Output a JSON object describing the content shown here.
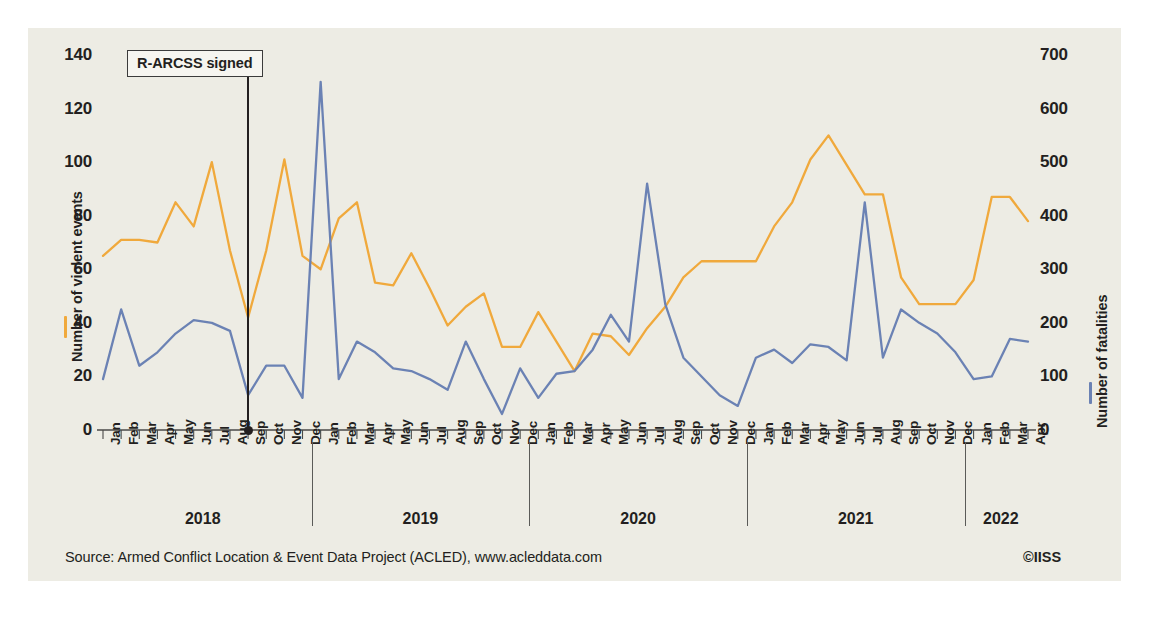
{
  "figure": {
    "source": "Source: Armed Conflict Location & Event Data Project (ACLED), www.acleddata.com",
    "copyright": "©IISS",
    "caption": ""
  },
  "colors": {
    "violent_events": "#f0a93c",
    "fatalities": "#6b82b4",
    "panel_background": "#edece4",
    "text": "#231f20",
    "annotation_line": "#231f20"
  },
  "chart_data": {
    "type": "line",
    "title": "",
    "xlabel": "",
    "ylabel": "Number of violent events",
    "y2label": "Number of fatalities",
    "ylim": [
      0,
      140
    ],
    "y2lim": [
      0,
      700
    ],
    "yticks": [
      0,
      20,
      40,
      60,
      80,
      100,
      120,
      140
    ],
    "y2ticks": [
      0,
      100,
      200,
      300,
      400,
      500,
      600,
      700
    ],
    "grid": false,
    "legend_position": "axis-titles",
    "month_labels": [
      "Jan",
      "Feb",
      "Mar",
      "Apr",
      "May",
      "Jun",
      "Jul",
      "Aug",
      "Sep",
      "Oct",
      "Nov",
      "Dec"
    ],
    "years": [
      "2018",
      "2019",
      "2020",
      "2021",
      "2022"
    ],
    "year_month_counts": [
      12,
      12,
      12,
      12,
      4
    ],
    "x": [
      "Jan 2018",
      "Feb 2018",
      "Mar 2018",
      "Apr 2018",
      "May 2018",
      "Jun 2018",
      "Jul 2018",
      "Aug 2018",
      "Sep 2018",
      "Oct 2018",
      "Nov 2018",
      "Dec 2018",
      "Jan 2019",
      "Feb 2019",
      "Mar 2019",
      "Apr 2019",
      "May 2019",
      "Jun 2019",
      "Jul 2019",
      "Aug 2019",
      "Sep 2019",
      "Oct 2019",
      "Nov 2019",
      "Dec 2019",
      "Jan 2020",
      "Feb 2020",
      "Mar 2020",
      "Apr 2020",
      "May 2020",
      "Jun 2020",
      "Jul 2020",
      "Aug 2020",
      "Sep 2020",
      "Oct 2020",
      "Nov 2020",
      "Dec 2020",
      "Jan 2021",
      "Feb 2021",
      "Mar 2021",
      "Apr 2021",
      "May 2021",
      "Jun 2021",
      "Jul 2021",
      "Aug 2021",
      "Sep 2021",
      "Oct 2021",
      "Nov 2021",
      "Dec 2021",
      "Jan 2022",
      "Feb 2022",
      "Mar 2022",
      "Apr 2022"
    ],
    "series": [
      {
        "name": "Number of violent events",
        "axis": "left",
        "color": "#f0a93c",
        "values": [
          65,
          71,
          71,
          70,
          85,
          76,
          100,
          67,
          42,
          67,
          101,
          65,
          60,
          79,
          85,
          55,
          54,
          66,
          53,
          39,
          46,
          51,
          31,
          31,
          44,
          33,
          22,
          36,
          35,
          28,
          38,
          46,
          57,
          63,
          63,
          63,
          63,
          76,
          85,
          101,
          110,
          99,
          88,
          88,
          57,
          47,
          47,
          47,
          56,
          87,
          87,
          78
        ]
      },
      {
        "name": "Number of fatalities",
        "axis": "right",
        "color": "#6b82b4",
        "values": [
          95,
          225,
          120,
          145,
          180,
          205,
          200,
          185,
          65,
          120,
          120,
          60,
          650,
          95,
          165,
          145,
          115,
          110,
          95,
          75,
          165,
          95,
          30,
          115,
          60,
          105,
          110,
          150,
          215,
          165,
          460,
          235,
          135,
          100,
          65,
          45,
          135,
          150,
          125,
          160,
          155,
          130,
          425,
          135,
          225,
          200,
          180,
          145,
          95,
          100,
          170,
          165
        ]
      }
    ],
    "annotation": {
      "label": "R-ARCSS signed",
      "x": "Sep 2018",
      "x_index": 8
    }
  },
  "axis": {
    "left_ticks": [
      "140",
      "120",
      "100",
      "80",
      "60",
      "40",
      "20",
      "0"
    ],
    "right_ticks": [
      "700",
      "600",
      "500",
      "400",
      "300",
      "200",
      "100",
      "0"
    ],
    "left_title": "Number of violent events",
    "right_title": "Number of fatalities"
  }
}
